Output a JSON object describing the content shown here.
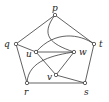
{
  "diagram": {
    "type": "graph",
    "nodes": [
      {
        "id": "p",
        "label": "p",
        "x": 55,
        "y": 15,
        "lx": 52,
        "ly": 11
      },
      {
        "id": "q",
        "label": "q",
        "x": 16,
        "y": 44,
        "lx": 4,
        "ly": 47
      },
      {
        "id": "t",
        "label": "t",
        "x": 94,
        "y": 44,
        "lx": 99,
        "ly": 47
      },
      {
        "id": "u",
        "label": "u",
        "x": 36,
        "y": 52,
        "lx": 26,
        "ly": 57
      },
      {
        "id": "w",
        "label": "w",
        "x": 74,
        "y": 52,
        "lx": 79,
        "ly": 55
      },
      {
        "id": "v",
        "label": "v",
        "x": 56,
        "y": 75,
        "lx": 47,
        "ly": 80
      },
      {
        "id": "r",
        "label": "r",
        "x": 27,
        "y": 83,
        "lx": 24,
        "ly": 95
      },
      {
        "id": "s",
        "label": "s",
        "x": 85,
        "y": 83,
        "lx": 84,
        "ly": 95
      }
    ],
    "edges": [
      {
        "from": "p",
        "to": "q",
        "path": "M55 15 L16 44"
      },
      {
        "from": "p",
        "to": "t",
        "path": "M55 15 L94 44"
      },
      {
        "from": "q",
        "to": "r",
        "path": "M16 44 L27 83"
      },
      {
        "from": "t",
        "to": "s",
        "path": "M94 44 L85 83"
      },
      {
        "from": "r",
        "to": "s",
        "path": "M27 83 L85 83"
      },
      {
        "from": "q",
        "to": "u",
        "path": "M16 44 L36 52"
      },
      {
        "from": "u",
        "to": "w",
        "path": "M36 52 L74 52"
      },
      {
        "from": "u",
        "to": "v",
        "path": "M36 52 L56 75"
      },
      {
        "from": "v",
        "to": "w",
        "path": "M56 75 L74 52"
      },
      {
        "from": "v",
        "to": "s",
        "path": "M56 75 L85 83"
      },
      {
        "from": "p",
        "to": "w",
        "path": "M55 15 C40 35 50 44 74 52"
      },
      {
        "from": "u",
        "to": "t",
        "path": "M36 52 C55 30 80 34 94 44"
      },
      {
        "from": "r",
        "to": "w",
        "path": "M27 83 C28 60 55 55 74 52"
      }
    ]
  }
}
